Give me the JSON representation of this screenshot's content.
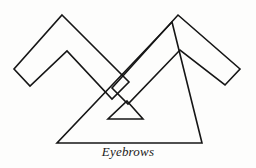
{
  "figure": {
    "caption": "Eyebrows",
    "background_color": "#fdfdfc",
    "stroke_color": "#161616",
    "fill_color": "none",
    "stroke_width": 1.6,
    "shapes": [
      {
        "name": "left-eyebrow",
        "type": "chevron-band",
        "description": "Outlined inverted-V band forming the left eyebrow, apex up, open ends pointing down-left and down-right",
        "points": "62,15 129,82 112,99 67,51 30,86 14,69"
      },
      {
        "name": "right-eyebrow",
        "type": "chevron-band",
        "description": "Outlined inverted-V band forming the right eyebrow, mirrored from the left",
        "points": "178,15 240,69 225,85 180,50 128,104 112,88"
      },
      {
        "name": "nose-triangle",
        "type": "triangle",
        "description": "Large open triangle below and between the eyebrows",
        "points": "172,22 202,143 57,143"
      },
      {
        "name": "inner-triangle",
        "type": "triangle",
        "description": "Small open triangle nested inside the large triangle",
        "points": "127,101 143,119 108,119"
      }
    ]
  }
}
